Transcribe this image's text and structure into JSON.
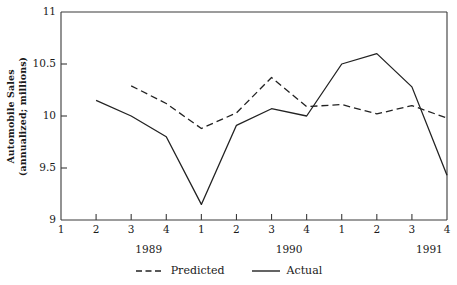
{
  "chart_data": {
    "type": "line",
    "title": "",
    "xlabel": "",
    "ylabel": "Automobile Sales (annualized; millions)",
    "ylabel_line1": "Automobile Sales",
    "ylabel_line2": "(annualized; millions)",
    "ylim": [
      9,
      11
    ],
    "ytick_labels": [
      "11",
      "10.5",
      "10",
      "9.5",
      "9"
    ],
    "ytick_values": [
      11,
      10.5,
      10,
      9.5,
      9
    ],
    "grid": false,
    "legend_position": "bottom-center",
    "x": [
      1,
      2,
      3,
      4,
      5,
      6,
      7,
      8,
      9,
      10,
      11,
      12
    ],
    "xtick_labels": [
      "1",
      "2",
      "3",
      "4",
      "1",
      "2",
      "3",
      "4",
      "1",
      "2",
      "3",
      "4"
    ],
    "categories": [
      "1989 Q1",
      "1989 Q2",
      "1989 Q3",
      "1989 Q4",
      "1990 Q1",
      "1990 Q2",
      "1990 Q3",
      "1990 Q4",
      "1991 Q1",
      "1991 Q2",
      "1991 Q3",
      "1991 Q4"
    ],
    "year_groups": [
      {
        "label": "1989",
        "center_index": 2.5
      },
      {
        "label": "1990",
        "center_index": 6.5
      },
      {
        "label": "1991",
        "center_index": 10.5
      }
    ],
    "series": [
      {
        "name": "Predicted",
        "style": "dashed",
        "color": "#222222",
        "values": [
          null,
          null,
          10.29,
          10.12,
          9.88,
          10.03,
          10.37,
          10.09,
          10.11,
          10.02,
          10.1,
          9.98
        ]
      },
      {
        "name": "Actual",
        "style": "solid",
        "color": "#222222",
        "values": [
          null,
          10.15,
          10.0,
          9.8,
          9.15,
          9.91,
          10.07,
          10.0,
          10.5,
          10.6,
          10.28,
          9.43
        ]
      }
    ]
  },
  "legend": {
    "items": [
      {
        "label": "Predicted",
        "style": "dashed"
      },
      {
        "label": "Actual",
        "style": "solid"
      }
    ]
  },
  "axes": {
    "plot_left": 61,
    "plot_right": 447,
    "plot_top": 12,
    "plot_bottom": 220
  }
}
